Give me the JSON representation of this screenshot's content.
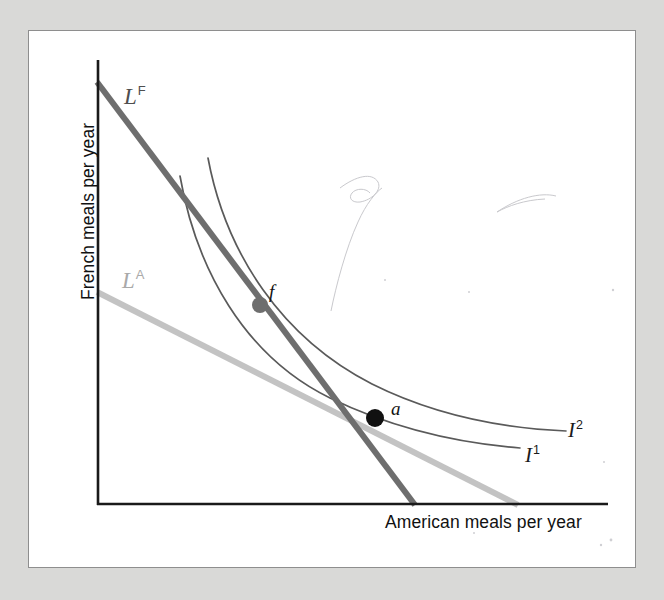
{
  "figure": {
    "type": "economics-indifference-curve-diagram",
    "background_color": "#d9d9d7",
    "panel_color": "#ffffff",
    "panel_border_color": "#8e8e8e"
  },
  "axes": {
    "y_label": "French meals per year",
    "x_label": "American meals per year",
    "axis_color": "#1a1a1a",
    "origin": {
      "x": 97,
      "y": 505
    },
    "x_end": {
      "x": 608,
      "y": 505
    },
    "y_top": {
      "x": 97,
      "y": 60
    }
  },
  "budget_lines": [
    {
      "id": "LF",
      "label": "L",
      "superscript": "F",
      "color": "#6e6e6e",
      "width": 6,
      "y_intercept": {
        "x": 97,
        "y": 82
      },
      "x_intercept": {
        "x": 415,
        "y": 505
      }
    },
    {
      "id": "LA",
      "label": "L",
      "superscript": "A",
      "color": "#c3c3c3",
      "width": 6,
      "y_intercept": {
        "x": 97,
        "y": 292
      },
      "x_intercept": {
        "x": 518,
        "y": 505
      }
    }
  ],
  "indifference_curves": [
    {
      "id": "I1",
      "label": "I",
      "superscript": "1",
      "color": "#5a5a5a",
      "width": 1.6,
      "path": "M 180 176 C 196 268, 244 356, 330 398 C 400 432, 470 444, 520 448"
    },
    {
      "id": "I2",
      "label": "I",
      "superscript": "2",
      "color": "#5a5a5a",
      "width": 1.6,
      "path": "M 208 158 C 226 254, 282 338, 372 384 C 444 420, 520 429, 566 431"
    }
  ],
  "points": [
    {
      "id": "f",
      "label": "f",
      "x": 260,
      "y": 305,
      "radius": 8,
      "color": "#6e6e6e",
      "description": "tangency of LF budget line with indifference curve I1"
    },
    {
      "id": "a",
      "label": "a",
      "x": 375,
      "y": 418,
      "radius": 9,
      "color": "#111111",
      "description": "tangency of LA budget line with indifference curve I1 and crossing of LF"
    }
  ],
  "artifacts": {
    "description": "faint pencil scan marks",
    "color": "#c8c8cc",
    "paths": [
      "M 340 188 C 356 176, 372 172, 378 182 C 382 190, 372 200, 360 202 C 352 203, 348 198, 352 193 C 356 188, 366 188, 370 193",
      "M 331 311 C 336 286, 346 248, 358 222 C 366 204, 376 192, 382 188",
      "M 497 212 C 518 198, 540 192, 556 196",
      "M 497 212 C 508 206, 524 200, 545 199"
    ],
    "dots": [
      {
        "x": 613,
        "y": 290,
        "r": 1.2
      },
      {
        "x": 469,
        "y": 292,
        "r": 1.0
      },
      {
        "x": 385,
        "y": 280,
        "r": 1.0
      },
      {
        "x": 611,
        "y": 540,
        "r": 1.4
      },
      {
        "x": 601,
        "y": 545,
        "r": 1.2
      },
      {
        "x": 604,
        "y": 462,
        "r": 1.0
      },
      {
        "x": 474,
        "y": 533,
        "r": 1.0
      }
    ]
  }
}
